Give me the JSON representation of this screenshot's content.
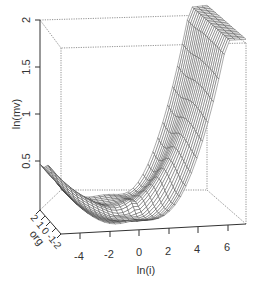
{
  "chart_data": {
    "type": "surface3d",
    "title": "",
    "axes": {
      "x": {
        "label": "ln(i)",
        "ticks": [
          "-4",
          "-2",
          "0",
          "2",
          "4",
          "6"
        ],
        "range": [
          -5,
          7.5
        ]
      },
      "y": {
        "label": "org",
        "ticks": [
          "2",
          "1",
          "0",
          "-1",
          "-2"
        ],
        "range": [
          -2,
          2
        ]
      },
      "z": {
        "label": "ln(mv)",
        "ticks": [
          "0.5",
          "1",
          "1.5",
          "2"
        ],
        "range": [
          0.2,
          2
        ]
      }
    },
    "surface_samples": [
      {
        "ln_i": -4,
        "ln_mv": 0.45
      },
      {
        "ln_i": -2,
        "ln_mv": 0.35
      },
      {
        "ln_i": 0,
        "ln_mv": 0.22
      },
      {
        "ln_i": 2,
        "ln_mv": 0.5
      },
      {
        "ln_i": 4,
        "ln_mv": 1.05
      },
      {
        "ln_i": 5.5,
        "ln_mv": 1.85
      }
    ],
    "grid": false,
    "legend": null
  },
  "labels": {
    "z_axis": "ln(mv)",
    "x_axis": "ln(i)",
    "y_axis": "org",
    "z_ticks": [
      "2",
      "1.5",
      "1",
      "0.5"
    ],
    "x_ticks": [
      "-4",
      "-2",
      "0",
      "2",
      "4",
      "6"
    ],
    "y_ticks": [
      "2",
      "1",
      "0",
      "-1",
      "-2"
    ]
  }
}
